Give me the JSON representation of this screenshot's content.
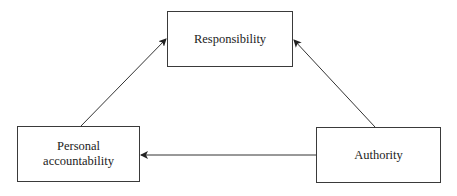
{
  "diagram": {
    "nodes": [
      {
        "id": "responsibility",
        "label": "Responsibility"
      },
      {
        "id": "personal_accountability",
        "label_line1": "Personal",
        "label_line2": "accountability"
      },
      {
        "id": "authority",
        "label": "Authority"
      }
    ],
    "edges": [
      {
        "from": "personal_accountability",
        "to": "responsibility"
      },
      {
        "from": "authority",
        "to": "responsibility"
      },
      {
        "from": "authority",
        "to": "personal_accountability"
      }
    ]
  }
}
